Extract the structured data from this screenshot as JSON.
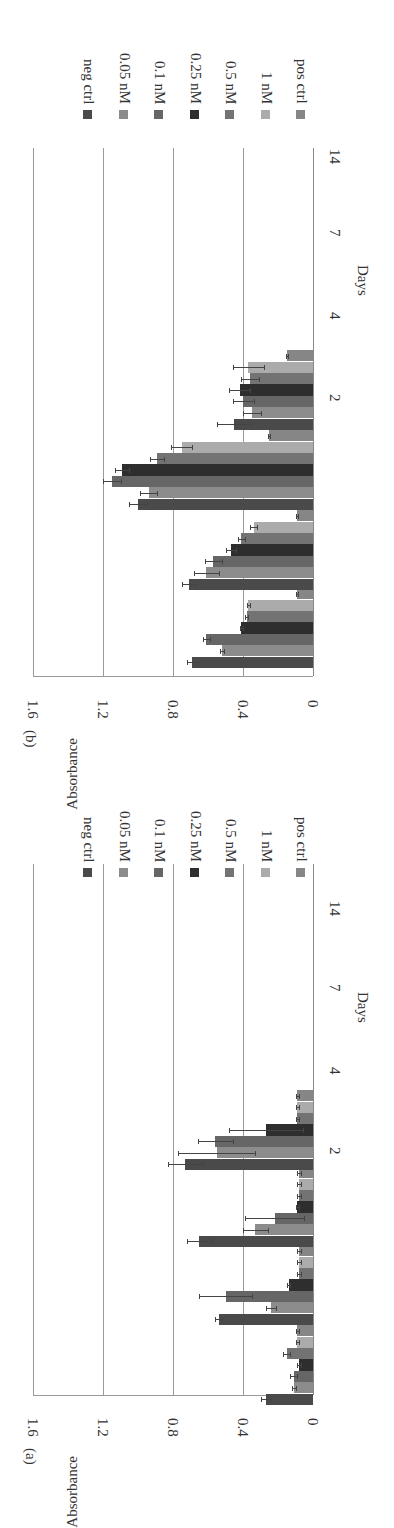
{
  "figure": {
    "series_colors": {
      "neg ctrl": "#4a4a4a",
      "0.05 nM": "#8c8c8c",
      "0.1 nM": "#666666",
      "0.25 nM": "#2e2e2e",
      "0.5 nM": "#737373",
      "1 nM": "#ababab",
      "pos ctrl": "#868686"
    },
    "panels": [
      {
        "label": "(b)",
        "ylabel": "Absorbance",
        "xlabel": "Days",
        "yticks": [
          "1.6",
          "1.2",
          "0.8",
          "0.4",
          "0"
        ],
        "categories": [
          "2",
          "4",
          "7",
          "14"
        ],
        "legend": [
          "neg ctrl",
          "0.05 nM",
          "0.1 nM",
          "0.25 nM",
          "0.5 nM",
          "1 nM",
          "pos ctrl"
        ]
      },
      {
        "label": "(a)",
        "ylabel": "Absorbance",
        "xlabel": "Days",
        "yticks": [
          "1.6",
          "1.2",
          "0.8",
          "0.4",
          "0"
        ],
        "categories": [
          "2",
          "4",
          "7",
          "14"
        ],
        "legend": [
          "neg ctrl",
          "0.05 nM",
          "0.1 nM",
          "0.25 nM",
          "0.5 nM",
          "1 nM",
          "pos ctrl"
        ]
      }
    ]
  },
  "chart_data": [
    {
      "type": "bar",
      "title": "(a)",
      "xlabel": "Days",
      "ylabel": "Absorbance",
      "ylim": [
        0,
        1.6
      ],
      "yticks": [
        0,
        0.4,
        0.8,
        1.2,
        1.6
      ],
      "grid": true,
      "legend_position": "right",
      "orientation_note": "figure rotated 90 degrees on page",
      "categories": [
        "2",
        "4",
        "7",
        "14"
      ],
      "series": [
        {
          "name": "neg ctrl",
          "values": [
            0.27,
            0.54,
            0.65,
            0.73
          ],
          "errors": [
            0.03,
            0.02,
            0.07,
            0.1
          ]
        },
        {
          "name": "0.05 nM",
          "values": [
            0.11,
            0.24,
            0.33,
            0.55
          ],
          "errors": [
            0.01,
            0.03,
            0.07,
            0.22
          ]
        },
        {
          "name": "0.1 nM",
          "values": [
            0.11,
            0.5,
            0.22,
            0.56
          ],
          "errors": [
            0.02,
            0.15,
            0.17,
            0.1
          ]
        },
        {
          "name": "0.25 nM",
          "values": [
            0.08,
            0.14,
            0.09,
            0.27
          ],
          "errors": [
            0.01,
            0.01,
            0.01,
            0.21
          ]
        },
        {
          "name": "0.5 nM",
          "values": [
            0.15,
            0.08,
            0.08,
            0.09
          ],
          "errors": [
            0.02,
            0.01,
            0.01,
            0.01
          ]
        },
        {
          "name": "1 nM",
          "values": [
            0.09,
            0.08,
            0.08,
            0.09
          ],
          "errors": [
            0.01,
            0.01,
            0.01,
            0.01
          ]
        },
        {
          "name": "pos ctrl",
          "values": [
            0.09,
            0.08,
            0.08,
            0.09
          ],
          "errors": [
            0.01,
            0.01,
            0.01,
            0.01
          ]
        }
      ]
    },
    {
      "type": "bar",
      "title": "(b)",
      "xlabel": "Days",
      "ylabel": "Absorbance",
      "ylim": [
        0,
        1.6
      ],
      "yticks": [
        0,
        0.4,
        0.8,
        1.2,
        1.6
      ],
      "grid": true,
      "legend_position": "right",
      "orientation_note": "figure rotated 90 degrees on page",
      "categories": [
        "2",
        "4",
        "7",
        "14"
      ],
      "series": [
        {
          "name": "neg ctrl",
          "values": [
            0.69,
            0.71,
            1.0,
            0.45
          ],
          "errors": [
            0.03,
            0.04,
            0.05,
            0.1
          ]
        },
        {
          "name": "0.05 nM",
          "values": [
            0.52,
            0.61,
            0.94,
            0.35
          ],
          "errors": [
            0.01,
            0.07,
            0.05,
            0.05
          ]
        },
        {
          "name": "0.1 nM",
          "values": [
            0.61,
            0.57,
            1.15,
            0.4
          ],
          "errors": [
            0.02,
            0.05,
            0.05,
            0.06
          ]
        },
        {
          "name": "0.25 nM",
          "values": [
            0.41,
            0.47,
            1.09,
            0.42
          ],
          "errors": [
            0.01,
            0.03,
            0.04,
            0.06
          ]
        },
        {
          "name": "0.5 nM",
          "values": [
            0.38,
            0.41,
            0.89,
            0.36
          ],
          "errors": [
            0.01,
            0.02,
            0.04,
            0.05
          ]
        },
        {
          "name": "1 nM",
          "values": [
            0.37,
            0.34,
            0.75,
            0.37
          ],
          "errors": [
            0.01,
            0.02,
            0.06,
            0.09
          ]
        },
        {
          "name": "pos ctrl",
          "values": [
            0.09,
            0.09,
            0.25,
            0.15
          ],
          "errors": [
            0.005,
            0.005,
            0.005,
            0.005
          ]
        }
      ]
    }
  ]
}
